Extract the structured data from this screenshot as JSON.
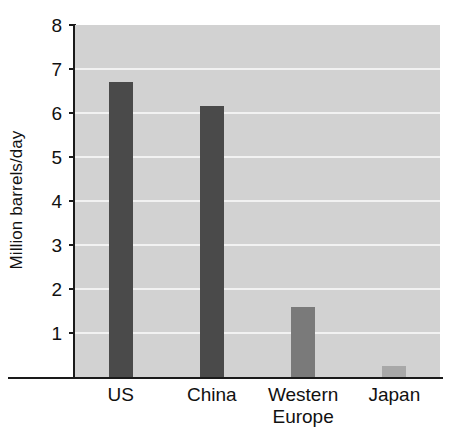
{
  "chart_data": {
    "type": "bar",
    "title": "",
    "xlabel": "",
    "ylabel": "Million barrels/day",
    "categories": [
      "US",
      "China",
      "Western\nEurope",
      "Japan"
    ],
    "values": [
      6.7,
      6.15,
      1.6,
      0.25
    ],
    "bar_colors": [
      "#4a4a4a",
      "#4a4a4a",
      "#7a7a7a",
      "#a8a8a8"
    ],
    "ylim": [
      0,
      8
    ],
    "yticks": [
      1,
      2,
      3,
      4,
      5,
      6,
      7,
      8
    ],
    "ytick_labels": [
      "1",
      "2",
      "3",
      "4",
      "5",
      "6",
      "7",
      "8"
    ],
    "gridlines": [
      1,
      2,
      3,
      4,
      5,
      6,
      7
    ],
    "grid": true,
    "grid_color": "#f2f2f2",
    "plot_background": "#d2d2d2",
    "figure_background": "#ffffff",
    "axis_color": "#1a1a1a",
    "legend": null,
    "legend_position": "none"
  }
}
